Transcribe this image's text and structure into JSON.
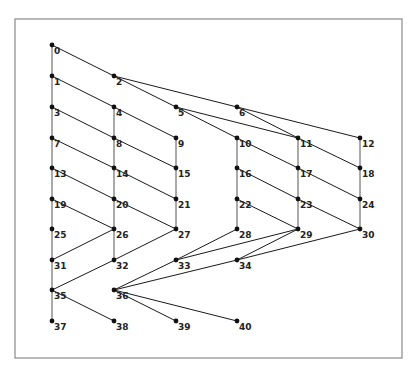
{
  "diagram": {
    "type": "directed-graph",
    "frame": {
      "x": 15,
      "y": 19,
      "width": 387,
      "height": 339
    },
    "columns_x": [
      52,
      114,
      176,
      237,
      298,
      360
    ],
    "rows_y": [
      45,
      76,
      107,
      138,
      168,
      199,
      229,
      260,
      290,
      321
    ],
    "nodes": [
      {
        "id": "0",
        "col": 0,
        "row": 0
      },
      {
        "id": "1",
        "col": 0,
        "row": 1
      },
      {
        "id": "2",
        "col": 1,
        "row": 1
      },
      {
        "id": "3",
        "col": 0,
        "row": 2
      },
      {
        "id": "4",
        "col": 1,
        "row": 2
      },
      {
        "id": "5",
        "col": 2,
        "row": 2
      },
      {
        "id": "6",
        "col": 3,
        "row": 2
      },
      {
        "id": "7",
        "col": 0,
        "row": 3
      },
      {
        "id": "8",
        "col": 1,
        "row": 3
      },
      {
        "id": "9",
        "col": 2,
        "row": 3
      },
      {
        "id": "10",
        "col": 3,
        "row": 3
      },
      {
        "id": "11",
        "col": 4,
        "row": 3
      },
      {
        "id": "12",
        "col": 5,
        "row": 3
      },
      {
        "id": "13",
        "col": 0,
        "row": 4
      },
      {
        "id": "14",
        "col": 1,
        "row": 4
      },
      {
        "id": "15",
        "col": 2,
        "row": 4
      },
      {
        "id": "16",
        "col": 3,
        "row": 4
      },
      {
        "id": "17",
        "col": 4,
        "row": 4
      },
      {
        "id": "18",
        "col": 5,
        "row": 4
      },
      {
        "id": "19",
        "col": 0,
        "row": 5
      },
      {
        "id": "20",
        "col": 1,
        "row": 5
      },
      {
        "id": "21",
        "col": 2,
        "row": 5
      },
      {
        "id": "22",
        "col": 3,
        "row": 5
      },
      {
        "id": "23",
        "col": 4,
        "row": 5
      },
      {
        "id": "24",
        "col": 5,
        "row": 5
      },
      {
        "id": "25",
        "col": 0,
        "row": 6
      },
      {
        "id": "26",
        "col": 1,
        "row": 6
      },
      {
        "id": "27",
        "col": 2,
        "row": 6
      },
      {
        "id": "28",
        "col": 3,
        "row": 6
      },
      {
        "id": "29",
        "col": 4,
        "row": 6
      },
      {
        "id": "30",
        "col": 5,
        "row": 6
      },
      {
        "id": "31",
        "col": 0,
        "row": 7
      },
      {
        "id": "32",
        "col": 1,
        "row": 7
      },
      {
        "id": "33",
        "col": 2,
        "row": 7
      },
      {
        "id": "34",
        "col": 3,
        "row": 7
      },
      {
        "id": "35",
        "col": 0,
        "row": 8
      },
      {
        "id": "36",
        "col": 1,
        "row": 8
      },
      {
        "id": "37",
        "col": 0,
        "row": 9
      },
      {
        "id": "38",
        "col": 1,
        "row": 9
      },
      {
        "id": "39",
        "col": 2,
        "row": 9
      },
      {
        "id": "40",
        "col": 3,
        "row": 9
      }
    ],
    "edges": [
      [
        "0",
        "1"
      ],
      [
        "1",
        "3"
      ],
      [
        "3",
        "7"
      ],
      [
        "7",
        "13"
      ],
      [
        "13",
        "19"
      ],
      [
        "19",
        "25"
      ],
      [
        "25",
        "31"
      ],
      [
        "31",
        "35"
      ],
      [
        "35",
        "37"
      ],
      [
        "4",
        "8"
      ],
      [
        "8",
        "14"
      ],
      [
        "14",
        "20"
      ],
      [
        "20",
        "26"
      ],
      [
        "26",
        "32"
      ],
      [
        "9",
        "15"
      ],
      [
        "15",
        "21"
      ],
      [
        "21",
        "27"
      ],
      [
        "10",
        "16"
      ],
      [
        "16",
        "22"
      ],
      [
        "22",
        "28"
      ],
      [
        "11",
        "17"
      ],
      [
        "17",
        "23"
      ],
      [
        "23",
        "29"
      ],
      [
        "12",
        "18"
      ],
      [
        "18",
        "24"
      ],
      [
        "24",
        "30"
      ],
      [
        "0",
        "2"
      ],
      [
        "1",
        "4"
      ],
      [
        "3",
        "8"
      ],
      [
        "7",
        "14"
      ],
      [
        "13",
        "20"
      ],
      [
        "19",
        "26"
      ],
      [
        "4",
        "9"
      ],
      [
        "8",
        "15"
      ],
      [
        "14",
        "21"
      ],
      [
        "20",
        "27"
      ],
      [
        "2",
        "5"
      ],
      [
        "2",
        "6"
      ],
      [
        "5",
        "10"
      ],
      [
        "5",
        "11"
      ],
      [
        "6",
        "11"
      ],
      [
        "6",
        "12"
      ],
      [
        "10",
        "17"
      ],
      [
        "16",
        "23"
      ],
      [
        "22",
        "29"
      ],
      [
        "11",
        "18"
      ],
      [
        "17",
        "24"
      ],
      [
        "23",
        "30"
      ],
      [
        "31",
        "26"
      ],
      [
        "32",
        "27"
      ],
      [
        "35",
        "32"
      ],
      [
        "35",
        "38"
      ],
      [
        "36",
        "33"
      ],
      [
        "36",
        "34"
      ],
      [
        "36",
        "39"
      ],
      [
        "36",
        "40"
      ],
      [
        "33",
        "28"
      ],
      [
        "33",
        "29"
      ],
      [
        "34",
        "29"
      ],
      [
        "34",
        "30"
      ]
    ]
  }
}
